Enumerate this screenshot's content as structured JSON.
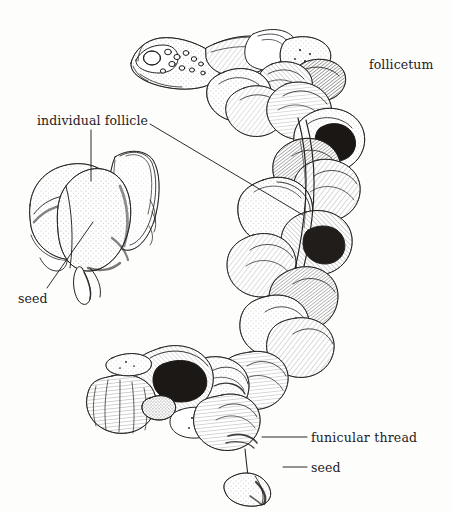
{
  "figure": {
    "medium": "pen-and-ink line drawing with stipple and hatching",
    "background_color": "#fdfdfc",
    "ink_color": "#231f1d",
    "width": 452,
    "height": 513
  },
  "labels": {
    "follicetum": "follicetum",
    "individual_follicle": "individual follicle",
    "seed_left": "seed",
    "funicular_thread": "funicular  thread",
    "seed_bottom": "seed"
  },
  "leader_lines": {
    "individual_follicle_vertical": {
      "x1": 91,
      "y1": 130,
      "x2": 91,
      "y2": 181
    },
    "individual_follicle_diagonal": {
      "x1": 150,
      "y1": 124,
      "x2": 303,
      "y2": 215
    },
    "seed_left_diagonal": {
      "x1": 47,
      "y1": 288,
      "x2": 93,
      "y2": 222
    },
    "funicular_thread": {
      "x1": 262,
      "y1": 437,
      "x2": 307,
      "y2": 437
    },
    "seed_bottom": {
      "x1": 283,
      "y1": 467,
      "x2": 307,
      "y2": 467
    }
  },
  "parts": {
    "follicetum_cluster": "crescent-shaped aggregate of many spirally-arranged dehisced follicles",
    "peduncle": "stalk at upper-left tip bearing circular scars",
    "detail_follicle": "enlarged single follicle at left showing seed in valve",
    "hanging_seed": "seed suspended below cluster on funicular thread"
  }
}
